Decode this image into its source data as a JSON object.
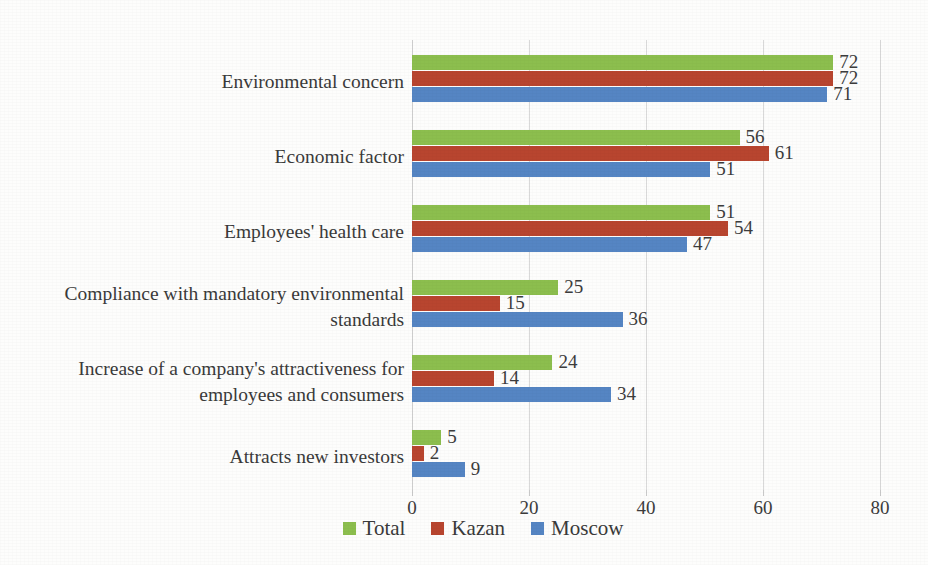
{
  "chart_data": {
    "type": "bar",
    "orientation": "horizontal",
    "title": "",
    "subtitle": "",
    "xlabel": "",
    "ylabel": "",
    "xlim": [
      0,
      80
    ],
    "xticks": [
      0,
      20,
      40,
      60,
      80
    ],
    "xtick_labels": [
      "0",
      "20",
      "40",
      "60",
      "80"
    ],
    "grid": true,
    "grid_axis": "x",
    "legend_position": "bottom",
    "categories": [
      "Environmental concern",
      "Economic factor",
      "Employees' health care",
      "Compliance with mandatory environmental standards",
      "Increase of a company's attractiveness for employees and consumers",
      "Attracts new investors"
    ],
    "series": [
      {
        "name": "Total",
        "color": "#8CBE4E",
        "values": [
          72,
          56,
          51,
          25,
          24,
          5
        ]
      },
      {
        "name": "Kazan",
        "color": "#B8452F",
        "values": [
          72,
          61,
          54,
          15,
          14,
          2
        ]
      },
      {
        "name": "Moscow",
        "color": "#5585C3",
        "values": [
          71,
          51,
          47,
          36,
          34,
          9
        ]
      }
    ],
    "data_labels": [
      {
        "category": "Environmental concern",
        "Total": "72",
        "Kazan": "72",
        "Moscow": "71"
      },
      {
        "category": "Economic factor",
        "Total": "56",
        "Kazan": "61",
        "Moscow": "51"
      },
      {
        "category": "Employees' health care",
        "Total": "51",
        "Kazan": "54",
        "Moscow": "47"
      },
      {
        "category": "Compliance with mandatory environmental standards",
        "Total": "25",
        "Kazan": "15",
        "Moscow": "36"
      },
      {
        "category": "Increase of a company's attractiveness for employees and consumers",
        "Total": "24",
        "Kazan": "14",
        "Moscow": "34"
      },
      {
        "category": "Attracts new investors",
        "Total": "5",
        "Kazan": "2",
        "Moscow": "9"
      }
    ]
  },
  "legend": {
    "items": [
      {
        "label": "Total",
        "color": "#8CBE4E"
      },
      {
        "label": "Kazan",
        "color": "#B8452F"
      },
      {
        "label": "Moscow",
        "color": "#5585C3"
      }
    ]
  },
  "colors": {
    "total": "#8CBE4E",
    "kazan": "#B8452F",
    "moscow": "#5585C3",
    "gridline": "#d9d9d9",
    "text": "#3a3a3a",
    "background": "#fdfdfc"
  }
}
